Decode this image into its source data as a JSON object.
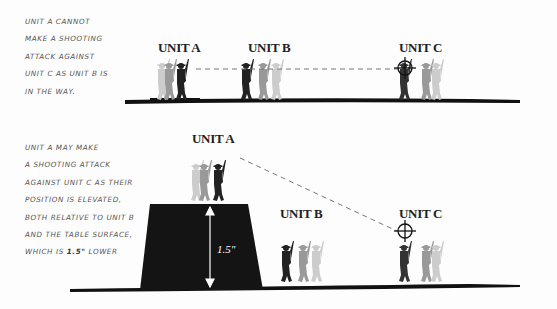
{
  "top_panel": {
    "caption_lines": [
      "Unit A cannot",
      "make a shooting",
      "attack against",
      "unit C as unit B is",
      "in the way."
    ],
    "labels": {
      "unit_a": "UNIT A",
      "unit_b": "UNIT B",
      "unit_c": "UNIT C"
    }
  },
  "bottom_panel": {
    "caption_lines": [
      "Unit A may make",
      "a shooting attack",
      "against unit C as their",
      "position is elevated,",
      "both relative to unit B",
      "and the table surface,"
    ],
    "caption_last_prefix": "which is ",
    "caption_last_emph": "1.5\"",
    "caption_last_suffix": " lower",
    "labels": {
      "unit_a": "UNIT A",
      "unit_b": "UNIT B",
      "unit_c": "UNIT C"
    },
    "height_label": "1.5\""
  }
}
